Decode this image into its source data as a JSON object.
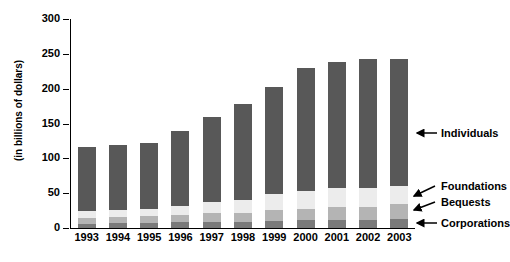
{
  "chart_data": {
    "type": "bar",
    "subtype": "stacked",
    "title": "",
    "xlabel": "",
    "ylabel": "(in billions of dollars)",
    "ylim": [
      0,
      300
    ],
    "yticks": [
      0,
      50,
      100,
      150,
      200,
      250,
      300
    ],
    "grid": false,
    "legend_position": "right-callouts",
    "categories": [
      "1993",
      "1994",
      "1995",
      "1996",
      "1997",
      "1998",
      "1999",
      "2000",
      "2001",
      "2002",
      "2003"
    ],
    "series": [
      {
        "name": "Corporations",
        "color": "#7a7a7a",
        "values": [
          6,
          7,
          7,
          8,
          9,
          9,
          10,
          11,
          12,
          12,
          13
        ]
      },
      {
        "name": "Bequests",
        "color": "#b4b4b4",
        "values": [
          9,
          9,
          10,
          11,
          13,
          13,
          16,
          17,
          18,
          18,
          21
        ]
      },
      {
        "name": "Foundations",
        "color": "#ececec",
        "values": [
          10,
          10,
          11,
          13,
          16,
          18,
          23,
          25,
          27,
          28,
          27
        ]
      },
      {
        "name": "Individuals",
        "color": "#585858",
        "values": [
          91,
          93,
          94,
          108,
          121,
          138,
          154,
          177,
          182,
          184,
          182
        ]
      }
    ],
    "totals": [
      116,
      119,
      122,
      140,
      159,
      178,
      203,
      230,
      239,
      242,
      243
    ]
  },
  "callouts": [
    {
      "label": "Individuals",
      "name": "callout-individuals"
    },
    {
      "label": "Foundations",
      "name": "callout-foundations"
    },
    {
      "label": "Bequests",
      "name": "callout-bequests"
    },
    {
      "label": "Corporations",
      "name": "callout-corporations"
    }
  ],
  "colors": {
    "individuals": "#585858",
    "foundations": "#ececec",
    "bequests": "#b4b4b4",
    "corporations": "#7a7a7a",
    "axis": "#000000",
    "background": "#ffffff"
  }
}
